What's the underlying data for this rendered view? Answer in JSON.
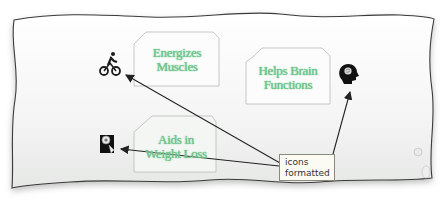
{
  "slide": {
    "shapes": [
      {
        "id": "energizes-muscles",
        "line1": "Energizes",
        "line2": "Muscles"
      },
      {
        "id": "helps-brain-functions",
        "line1": "Helps Brain",
        "line2": "Functions"
      },
      {
        "id": "aids-weight-loss",
        "line1": "Aids in",
        "line2": "Weight Loss"
      }
    ],
    "icons": [
      {
        "name": "bicycle-rider-icon",
        "near": "Energizes Muscles"
      },
      {
        "name": "brain-head-icon",
        "near": "Helps Brain Functions"
      },
      {
        "name": "weight-scale-icon",
        "near": "Aids in Weight Loss"
      }
    ],
    "callout": {
      "line1": "icons",
      "line2": "formatted"
    },
    "colors": {
      "shape_text": "#6cc48a",
      "paper": "#f7f7f7",
      "arrow": "#222222"
    }
  }
}
